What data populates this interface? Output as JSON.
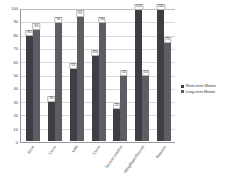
{
  "chart_data": {
    "type": "bar",
    "title": "",
    "subtitle": "",
    "xlabel": "",
    "ylabel": "",
    "ylim": [
      0,
      100
    ],
    "yticks": [
      0,
      10,
      20,
      30,
      40,
      50,
      60,
      70,
      80,
      90,
      100
    ],
    "grid": true,
    "legend_position": "right",
    "categories": [
      "Drive",
      "Curve",
      "VPR",
      "Curve",
      "Second position",
      "Wing/Ratio/Second",
      "Random"
    ],
    "series": [
      {
        "name": "Short-term Motion",
        "color": "#3e3e44",
        "values": [
          80,
          30,
          55,
          65,
          25,
          100,
          100
        ]
      },
      {
        "name": "Long-term Motion",
        "color": "#5d5d63",
        "values": [
          85,
          90,
          95,
          90,
          50,
          50,
          75
        ]
      }
    ]
  },
  "legend": {
    "items": [
      {
        "label": "Short-term Motion"
      },
      {
        "label": "Long-term Motion"
      }
    ]
  }
}
